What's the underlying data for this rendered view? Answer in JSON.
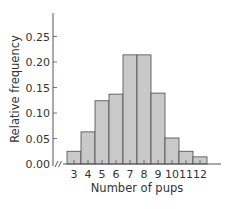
{
  "chart_data": {
    "type": "bar",
    "title": "",
    "xlabel": "Number of pups",
    "ylabel": "Relative frequency",
    "categories": [
      "3",
      "4",
      "5",
      "6",
      "7",
      "8",
      "9",
      "10",
      "11",
      "12"
    ],
    "values": [
      0.025,
      0.063,
      0.124,
      0.137,
      0.214,
      0.214,
      0.139,
      0.051,
      0.025,
      0.014
    ],
    "yticks": [
      "0.00",
      "0.05",
      "0.10",
      "0.15",
      "0.20",
      "0.25"
    ],
    "ylim": [
      0,
      0.29
    ],
    "grid": false,
    "legend": null,
    "axis_break": true,
    "colors": {
      "bar_fill": "#c9c9c9",
      "bar_stroke": "#4a4a4a",
      "axis": "#555555",
      "text": "#333333"
    }
  }
}
